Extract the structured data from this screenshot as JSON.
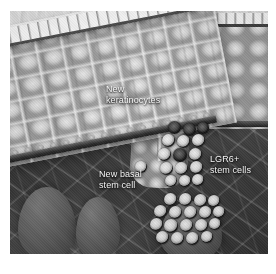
{
  "figure": {
    "kind": "scientific-illustration",
    "palette": {
      "background": "#ffffff",
      "epidermis": "#c6c6c6",
      "dermis": "#3c3c3c",
      "stem_cell_dark": "#0d0d0d",
      "stem_cell_core": "#f0f0f0",
      "label_text": "#f3f3f3"
    }
  },
  "labels": {
    "keratinocytes": "New\nkeratinocytes",
    "basal_stem_cell": "New basal\nstem cell",
    "lgr6_stem_cells": "LGR6+\nstem cells"
  },
  "structures": {
    "air": "air-above-skin",
    "stratum_corneum": "cornified-layer",
    "epidermis": "epidermis-keratinocyte-layer",
    "basal_layer": "basal-lamina",
    "dermis": "dermis-collagen-matrix",
    "hair_follicle": "hair-follicle-canal",
    "hair_shaft": "hair-shaft",
    "bulge_cluster_upper": "lgr6-stem-cell-cluster-upper",
    "bulge_cluster_lower": "lgr6-stem-cell-cluster-lower"
  },
  "cells": {
    "upper_cluster": [
      {
        "x": 10,
        "y": 0,
        "d": 13,
        "dark": true
      },
      {
        "x": 25,
        "y": 2,
        "d": 13,
        "dark": true
      },
      {
        "x": 39,
        "y": 1,
        "d": 12,
        "dark": true
      },
      {
        "x": 4,
        "y": 13,
        "d": 13,
        "dark": false
      },
      {
        "x": 19,
        "y": 14,
        "d": 13,
        "dark": false
      },
      {
        "x": 34,
        "y": 13,
        "d": 13,
        "dark": false
      },
      {
        "x": 0,
        "y": 27,
        "d": 13,
        "dark": false
      },
      {
        "x": 15,
        "y": 27,
        "d": 14,
        "dark": true
      },
      {
        "x": 31,
        "y": 27,
        "d": 13,
        "dark": false
      },
      {
        "x": 2,
        "y": 41,
        "d": 13,
        "dark": false
      },
      {
        "x": 17,
        "y": 41,
        "d": 13,
        "dark": false
      },
      {
        "x": 32,
        "y": 40,
        "d": 13,
        "dark": false
      },
      {
        "x": 7,
        "y": 54,
        "d": 12,
        "dark": false
      },
      {
        "x": 21,
        "y": 54,
        "d": 12,
        "dark": false
      },
      {
        "x": 34,
        "y": 53,
        "d": 12,
        "dark": false
      }
    ],
    "lower_cluster": [
      {
        "x": 14,
        "y": 0,
        "d": 13,
        "dark": false
      },
      {
        "x": 29,
        "y": 0,
        "d": 13,
        "dark": false
      },
      {
        "x": 44,
        "y": 1,
        "d": 13,
        "dark": false
      },
      {
        "x": 58,
        "y": 2,
        "d": 12,
        "dark": false
      },
      {
        "x": 4,
        "y": 12,
        "d": 13,
        "dark": false
      },
      {
        "x": 19,
        "y": 13,
        "d": 13,
        "dark": false
      },
      {
        "x": 34,
        "y": 13,
        "d": 13,
        "dark": false
      },
      {
        "x": 49,
        "y": 13,
        "d": 13,
        "dark": false
      },
      {
        "x": 63,
        "y": 13,
        "d": 12,
        "dark": false
      },
      {
        "x": 0,
        "y": 25,
        "d": 13,
        "dark": false
      },
      {
        "x": 14,
        "y": 26,
        "d": 14,
        "dark": false
      },
      {
        "x": 30,
        "y": 26,
        "d": 13,
        "dark": false
      },
      {
        "x": 45,
        "y": 26,
        "d": 13,
        "dark": false
      },
      {
        "x": 59,
        "y": 25,
        "d": 12,
        "dark": false
      },
      {
        "x": 6,
        "y": 38,
        "d": 13,
        "dark": false
      },
      {
        "x": 21,
        "y": 39,
        "d": 13,
        "dark": false
      },
      {
        "x": 36,
        "y": 39,
        "d": 13,
        "dark": false
      },
      {
        "x": 51,
        "y": 38,
        "d": 12,
        "dark": false
      }
    ],
    "basal_stem_cell": [
      {
        "x": 0,
        "y": 0,
        "d": 12,
        "dark": false
      }
    ]
  }
}
